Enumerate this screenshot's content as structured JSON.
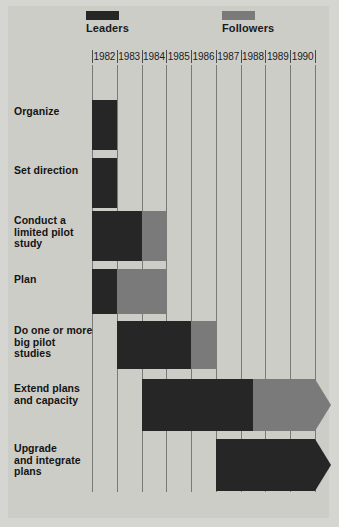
{
  "legend": [
    {
      "id": "leaders",
      "label": "Leaders",
      "color": "#262626"
    },
    {
      "id": "followers",
      "label": "Followers",
      "color": "#7a7a7a"
    }
  ],
  "colors": {
    "page_background": "#d5d5d1",
    "plate_background": "#cdcdc8",
    "gridline": "#6a6a6a",
    "leaders": "#262626",
    "followers": "#7a7a7a",
    "text": "#141414"
  },
  "chart_data": {
    "type": "bar",
    "subtype": "gantt",
    "title": "",
    "xlabel": "",
    "ylabel": "",
    "grid": true,
    "legend_position": "top",
    "categories": [
      "Organize",
      "Set direction",
      "Conduct a\nlimited pilot\nstudy",
      "Plan",
      "Do one or more\nbig pilot\nstudies",
      "Extend plans\nand capacity",
      "Upgrade\nand integrate\nplans"
    ],
    "x_tick_labels": [
      "1982",
      "1983",
      "1984",
      "1985",
      "1986",
      "1987",
      "1988",
      "1989",
      "1990"
    ],
    "xlim": [
      1982,
      1991
    ],
    "series": [
      {
        "name": "Leaders",
        "color": "#262626"
      },
      {
        "name": "Followers",
        "color": "#7a7a7a"
      }
    ],
    "tasks": [
      {
        "label": "Organize",
        "label_lines": [
          "Organize"
        ],
        "bars": [
          {
            "series": "Leaders",
            "start": 1982.0,
            "end": 1983.0,
            "arrow": false
          }
        ]
      },
      {
        "label": "Set direction",
        "label_lines": [
          "Set direction"
        ],
        "bars": [
          {
            "series": "Leaders",
            "start": 1982.0,
            "end": 1983.0,
            "arrow": false
          }
        ]
      },
      {
        "label": "Conduct a limited pilot study",
        "label_lines": [
          "Conduct a",
          "limited pilot",
          "study"
        ],
        "bars": [
          {
            "series": "Leaders",
            "start": 1982.0,
            "end": 1984.0,
            "arrow": false
          },
          {
            "series": "Followers",
            "start": 1984.0,
            "end": 1985.0,
            "arrow": false
          }
        ]
      },
      {
        "label": "Plan",
        "label_lines": [
          "Plan"
        ],
        "bars": [
          {
            "series": "Leaders",
            "start": 1982.0,
            "end": 1983.0,
            "arrow": false
          },
          {
            "series": "Followers",
            "start": 1983.0,
            "end": 1985.0,
            "arrow": false
          }
        ]
      },
      {
        "label": "Do one or more big pilot studies",
        "label_lines": [
          "Do one or more",
          "big pilot",
          "studies"
        ],
        "bars": [
          {
            "series": "Leaders",
            "start": 1983.0,
            "end": 1986.0,
            "arrow": false
          },
          {
            "series": "Followers",
            "start": 1986.0,
            "end": 1987.0,
            "arrow": false
          }
        ]
      },
      {
        "label": "Extend plans and capacity",
        "label_lines": [
          "Extend plans",
          "and capacity"
        ],
        "bars": [
          {
            "series": "Leaders",
            "start": 1984.0,
            "end": 1988.5,
            "arrow": false
          },
          {
            "series": "Followers",
            "start": 1988.5,
            "end": 1991.0,
            "arrow": true
          }
        ]
      },
      {
        "label": "Upgrade and integrate plans",
        "label_lines": [
          "Upgrade",
          "and integrate",
          "plans"
        ],
        "bars": [
          {
            "series": "Leaders",
            "start": 1987.0,
            "end": 1991.0,
            "arrow": true
          }
        ]
      }
    ]
  }
}
